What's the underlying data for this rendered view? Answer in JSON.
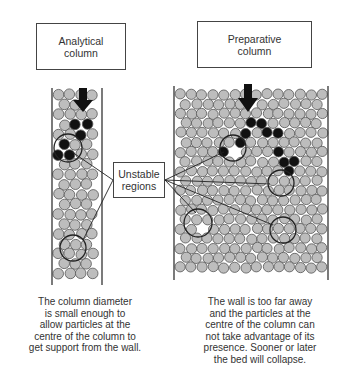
{
  "labels": {
    "analytical": [
      "Analytical",
      "column"
    ],
    "preparative": [
      "Preparative",
      "column"
    ],
    "unstable": [
      "Unstable",
      "regions"
    ]
  },
  "captions": {
    "left": "The column diameter\nis small enough to\nallow particles at the\ncentre of the column to\nget support from the wall.",
    "right": "The wall is too far away\nand the particles at the\ncentre of the column can\nnot take advantage of its\npresence. Sooner or later\nthe bed will collapse."
  },
  "colors": {
    "particle_fill": "#bdbdbd",
    "particle_stroke": "#555555",
    "falling_particle": "#111111",
    "wall": "#333333",
    "arrow": "#111111"
  },
  "columns": {
    "analytical": {
      "x_left": 52,
      "x_right": 102,
      "y_top": 88,
      "y_bottom": 285
    },
    "preparative": {
      "x_left": 174,
      "x_right": 328,
      "y_top": 88,
      "y_bottom": 278
    }
  }
}
